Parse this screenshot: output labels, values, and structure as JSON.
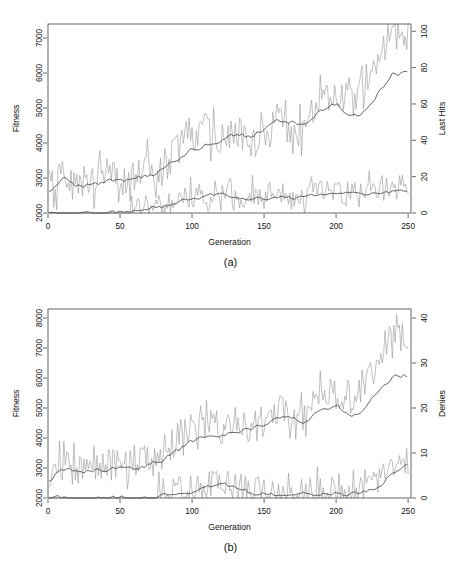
{
  "figure": {
    "panels": [
      {
        "id": "a",
        "caption": "(a)",
        "xlabel": "Generation",
        "ylabel_left": "Fitness",
        "ylabel_right": "Last Hits",
        "x_ticks": [
          0,
          50,
          100,
          150,
          200,
          250
        ],
        "y_left_ticks": [
          2000,
          3000,
          4000,
          5000,
          6000,
          7000
        ],
        "y_right_ticks": [
          0,
          20,
          40,
          60,
          80,
          100
        ]
      },
      {
        "id": "b",
        "caption": "(b)",
        "xlabel": "Generation",
        "ylabel_left": "Fitness",
        "ylabel_right": "Denies",
        "x_ticks": [
          0,
          50,
          100,
          150,
          200,
          250
        ],
        "y_left_ticks": [
          2000,
          3000,
          4000,
          5000,
          6000,
          7000,
          8000
        ],
        "y_right_ticks": [
          0,
          10,
          20,
          30,
          40
        ]
      }
    ],
    "colors": {
      "raw_line": "#9a9a9a",
      "smooth_line": "#3c3c3c",
      "frame": "#555555",
      "text": "#111111",
      "background": "#ffffff"
    }
  },
  "chart_data": [
    {
      "type": "line",
      "panel": "a",
      "title": "",
      "xlabel": "Generation",
      "ylabel": "Fitness",
      "ylabel_secondary": "Last Hits",
      "xlim": [
        0,
        252
      ],
      "ylim": [
        2000,
        7400
      ],
      "ylim_secondary": [
        0,
        104
      ],
      "grid": false,
      "legend": "none",
      "x_ticks": [
        0,
        50,
        100,
        150,
        200,
        250
      ],
      "y_ticks": [
        2000,
        3000,
        4000,
        5000,
        6000,
        7000
      ],
      "y_ticks_secondary": [
        0,
        20,
        40,
        60,
        80,
        100
      ],
      "series": [
        {
          "name": "Fitness (raw)",
          "axis": "left",
          "style": "noisy",
          "color": "#9a9a9a",
          "x": [
            1,
            10,
            20,
            30,
            40,
            50,
            60,
            70,
            80,
            90,
            100,
            110,
            120,
            130,
            140,
            150,
            160,
            170,
            180,
            190,
            200,
            210,
            220,
            230,
            240,
            250
          ],
          "values": [
            2560,
            3050,
            2720,
            2850,
            3000,
            2900,
            3050,
            3150,
            3250,
            3800,
            4250,
            4300,
            4100,
            4400,
            4000,
            4300,
            4700,
            3900,
            4600,
            5600,
            5100,
            5200,
            5400,
            6400,
            7200,
            6900
          ],
          "noise_amplitude": 520,
          "noise_seed": 17
        },
        {
          "name": "Fitness (smoothed)",
          "axis": "left",
          "style": "smooth",
          "color": "#3c3c3c",
          "x": [
            1,
            10,
            20,
            30,
            40,
            50,
            60,
            70,
            80,
            90,
            100,
            110,
            120,
            130,
            140,
            150,
            160,
            170,
            180,
            190,
            200,
            210,
            220,
            230,
            240,
            250
          ],
          "values": [
            2560,
            2960,
            2800,
            2820,
            2900,
            2880,
            2940,
            3060,
            3200,
            3480,
            3820,
            3980,
            4060,
            4180,
            4200,
            4380,
            4620,
            4560,
            4480,
            4900,
            5080,
            4720,
            4880,
            5500,
            6000,
            5950
          ],
          "noise_amplitude": 70,
          "noise_seed": 23
        },
        {
          "name": "Last Hits (raw)",
          "axis": "right",
          "style": "noisy",
          "color": "#9a9a9a",
          "x": [
            1,
            10,
            20,
            30,
            40,
            50,
            55,
            60,
            70,
            80,
            90,
            100,
            110,
            120,
            130,
            140,
            150,
            160,
            170,
            180,
            190,
            200,
            210,
            220,
            230,
            240,
            250
          ],
          "values": [
            0,
            0,
            0,
            0,
            0,
            0,
            1,
            2,
            3,
            4,
            6,
            9,
            10,
            11,
            8,
            9,
            8,
            10,
            7,
            9,
            13,
            9,
            11,
            12,
            11,
            12,
            16
          ],
          "noise_amplitude": 6.5,
          "noise_seed": 41
        },
        {
          "name": "Last Hits (smoothed)",
          "axis": "right",
          "style": "smooth",
          "color": "#3c3c3c",
          "x": [
            1,
            10,
            20,
            30,
            40,
            50,
            55,
            60,
            70,
            80,
            90,
            100,
            110,
            120,
            130,
            140,
            150,
            160,
            170,
            180,
            190,
            200,
            210,
            220,
            230,
            240,
            250
          ],
          "values": [
            0,
            0,
            0,
            0,
            0,
            0,
            0.6,
            1.4,
            2.6,
            3.4,
            5.4,
            8.2,
            9.4,
            9.6,
            8.6,
            8.4,
            8.2,
            8.6,
            8.0,
            8.4,
            10.2,
            10.4,
            10.6,
            11.0,
            11.2,
            11.8,
            13.2
          ],
          "noise_amplitude": 0.9,
          "noise_seed": 7
        }
      ]
    },
    {
      "type": "line",
      "panel": "b",
      "title": "",
      "xlabel": "Generation",
      "ylabel": "Fitness",
      "ylabel_secondary": "Denies",
      "xlim": [
        0,
        252
      ],
      "ylim": [
        2000,
        8300
      ],
      "ylim_secondary": [
        0,
        42
      ],
      "grid": false,
      "legend": "none",
      "x_ticks": [
        0,
        50,
        100,
        150,
        200,
        250
      ],
      "y_ticks": [
        2000,
        3000,
        4000,
        5000,
        6000,
        7000,
        8000
      ],
      "y_ticks_secondary": [
        0,
        10,
        20,
        30,
        40
      ],
      "series": [
        {
          "name": "Fitness (raw)",
          "axis": "left",
          "style": "noisy",
          "color": "#9a9a9a",
          "x": [
            1,
            10,
            20,
            30,
            40,
            50,
            60,
            70,
            80,
            90,
            100,
            110,
            120,
            130,
            140,
            150,
            160,
            170,
            180,
            190,
            200,
            210,
            220,
            230,
            240,
            250
          ],
          "values": [
            2620,
            3080,
            2750,
            2950,
            3050,
            3000,
            3100,
            3200,
            3300,
            3950,
            4300,
            4500,
            4200,
            4600,
            4150,
            4550,
            5000,
            4300,
            4850,
            5700,
            5200,
            5350,
            5600,
            6700,
            7500,
            7000
          ],
          "noise_amplitude": 560,
          "noise_seed": 31
        },
        {
          "name": "Fitness (smoothed)",
          "axis": "left",
          "style": "smooth",
          "color": "#3c3c3c",
          "x": [
            1,
            10,
            20,
            30,
            40,
            50,
            60,
            70,
            80,
            90,
            100,
            110,
            120,
            130,
            140,
            150,
            160,
            170,
            180,
            190,
            200,
            210,
            220,
            230,
            240,
            250
          ],
          "values": [
            2620,
            3000,
            2850,
            2900,
            2960,
            2950,
            3000,
            3120,
            3250,
            3560,
            3880,
            4020,
            4120,
            4260,
            4250,
            4450,
            4720,
            4620,
            4550,
            4980,
            5120,
            4800,
            4960,
            5600,
            6050,
            6080
          ],
          "noise_amplitude": 70,
          "noise_seed": 53
        },
        {
          "name": "Denies (raw)",
          "axis": "right",
          "style": "noisy",
          "color": "#9a9a9a",
          "x": [
            1,
            20,
            40,
            60,
            75,
            80,
            90,
            100,
            110,
            120,
            130,
            140,
            150,
            160,
            170,
            180,
            190,
            200,
            210,
            220,
            230,
            240,
            250
          ],
          "values": [
            0,
            0,
            0,
            0,
            0,
            0.8,
            1.4,
            1.6,
            2.6,
            3.2,
            2.4,
            1.2,
            1.0,
            1.0,
            0.9,
            1.0,
            1.4,
            1.4,
            1.0,
            1.6,
            3.6,
            6.2,
            8.0
          ],
          "noise_amplitude": 3.2,
          "noise_seed": 61
        },
        {
          "name": "Denies (smoothed)",
          "axis": "right",
          "style": "smooth",
          "color": "#3c3c3c",
          "x": [
            1,
            20,
            40,
            60,
            75,
            80,
            90,
            100,
            110,
            120,
            130,
            140,
            150,
            160,
            170,
            180,
            190,
            200,
            210,
            220,
            230,
            240,
            250
          ],
          "values": [
            0,
            0,
            0,
            0,
            0,
            0.5,
            1.2,
            1.5,
            2.4,
            3.0,
            2.2,
            1.1,
            0.9,
            0.9,
            0.8,
            0.9,
            1.2,
            1.3,
            0.9,
            1.4,
            3.0,
            5.6,
            7.4
          ],
          "noise_amplitude": 0.45,
          "noise_seed": 83
        }
      ]
    }
  ]
}
